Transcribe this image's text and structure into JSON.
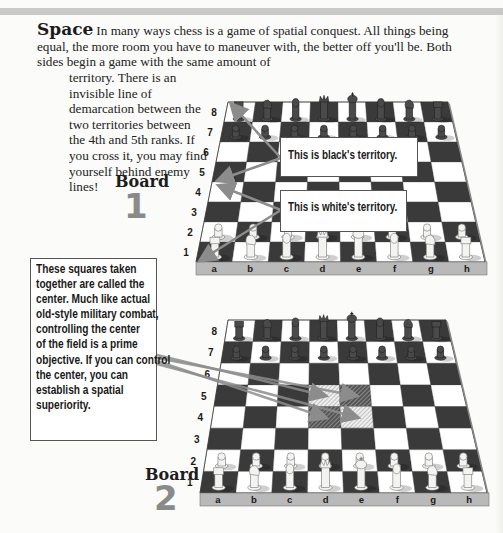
{
  "section": {
    "heading": "Space",
    "intro_line1": "In many ways chess is a game of spatial conquest. All things being equal, the more room you have to maneuver with, the better off you'll be. Both sides begin a game with the same amount of",
    "intro_line2": "territory. There is an invisible line of demarcation between the two territories between the 4th and 5th ranks. If you cross it, you may find yourself behind enemy lines!"
  },
  "board1": {
    "label": "Board",
    "number": "1",
    "callout_black": "This is black's territory.",
    "callout_white": "This is white's territory.",
    "ranks": [
      "8",
      "7",
      "6",
      "5",
      "4",
      "3",
      "2",
      "1"
    ],
    "files": [
      "a",
      "b",
      "c",
      "d",
      "e",
      "f",
      "g",
      "h"
    ]
  },
  "board2": {
    "label": "Board",
    "number": "2",
    "center_note": [
      "These squares taken",
      "together are called the",
      "center. Much like actual",
      "old-style military combat,",
      "controlling the center",
      "of the field is a prime",
      "objective. If you can control",
      "the center, you can",
      "establish a spatial",
      "superiority."
    ],
    "ranks": [
      "8",
      "7",
      "6",
      "5",
      "4",
      "3",
      "2",
      "1"
    ],
    "files": [
      "a",
      "b",
      "c",
      "d",
      "e",
      "f",
      "g",
      "h"
    ],
    "highlighted_squares": [
      "d4",
      "e4",
      "d5",
      "e5"
    ]
  },
  "colors": {
    "dark_square": "#3a3a3a",
    "light_square": "#ffffff",
    "arrow": "#8c8c8c",
    "board_edge": "#b9b9b9",
    "number_gray": "#8a8a8a"
  },
  "pieces": {
    "black_back_rank": [
      "rook",
      "knight",
      "bishop",
      "queen",
      "king",
      "bishop",
      "knight",
      "rook"
    ],
    "white_back_rank": [
      "rook",
      "knight",
      "bishop",
      "queen",
      "king",
      "bishop",
      "knight",
      "rook"
    ]
  }
}
